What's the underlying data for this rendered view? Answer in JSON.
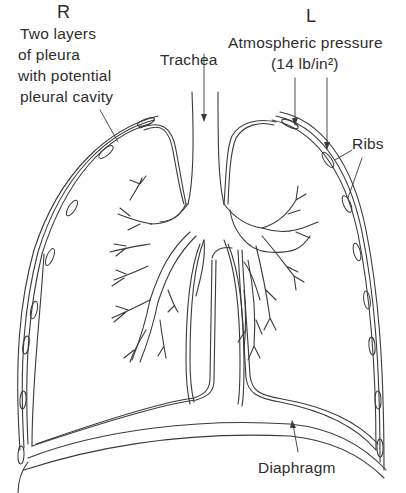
{
  "diagram": {
    "type": "anatomical line drawing",
    "colors": {
      "line": "#3a3a3a",
      "background": "#ffffff",
      "text": "#2e2e2e"
    }
  },
  "labels": {
    "right_side": "R",
    "left_side": "L",
    "pleura": [
      "Two layers",
      "of pleura",
      "with potential",
      "pleural cavity"
    ],
    "trachea": "Trachea",
    "atmospheric": "Atmospheric pressure",
    "pressure_value": "(14 lb/in²)",
    "ribs": "Ribs",
    "diaphragm": "Diaphragm"
  },
  "pointers": [
    {
      "label": "pleura",
      "from": [
        100,
        110
      ],
      "to": [
        118,
        142
      ]
    },
    {
      "label": "trachea",
      "from": [
        204,
        52
      ],
      "to": [
        204,
        122
      ]
    },
    {
      "label": "atmospheric-1",
      "from": [
        295,
        78
      ],
      "to": [
        295,
        125
      ]
    },
    {
      "label": "atmospheric-2",
      "from": [
        327,
        78
      ],
      "to": [
        327,
        150
      ]
    },
    {
      "label": "ribs-1",
      "from": [
        352,
        150
      ],
      "to": [
        334,
        160
      ]
    },
    {
      "label": "ribs-2",
      "from": [
        362,
        158
      ],
      "to": [
        347,
        198
      ]
    },
    {
      "label": "diaphragm",
      "from": [
        298,
        452
      ],
      "to": [
        292,
        424
      ]
    }
  ]
}
